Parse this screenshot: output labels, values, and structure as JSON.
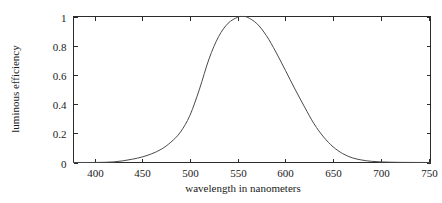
{
  "chart_data": {
    "type": "line",
    "title": "",
    "xlabel": "wavelength in nanometers",
    "ylabel": "luminous efficiency",
    "xlim": [
      378,
      752
    ],
    "ylim": [
      0,
      1
    ],
    "grid": false,
    "legend": null,
    "xticks": [
      400,
      450,
      500,
      550,
      600,
      650,
      700,
      750
    ],
    "xtick_labels": [
      "400",
      "450",
      "500",
      "550",
      "600",
      "650",
      "700",
      "750"
    ],
    "yticks": [
      0,
      0.2,
      0.4,
      0.6,
      0.8,
      1
    ],
    "ytick_labels": [
      "0",
      "0.2",
      "0.4",
      "0.6",
      "0.8",
      "1"
    ],
    "series": [
      {
        "name": "luminous efficiency",
        "color": "#4a4a4a",
        "x": [
          378,
          390,
          400,
          410,
          420,
          430,
          440,
          450,
          460,
          470,
          480,
          490,
          500,
          510,
          520,
          530,
          540,
          550,
          555,
          560,
          570,
          580,
          590,
          600,
          610,
          620,
          630,
          640,
          650,
          660,
          670,
          680,
          690,
          700,
          710,
          720,
          730,
          740,
          752
        ],
        "y": [
          0.0,
          0.0001,
          0.0004,
          0.0012,
          0.004,
          0.0116,
          0.023,
          0.038,
          0.06,
          0.091,
          0.139,
          0.208,
          0.323,
          0.503,
          0.71,
          0.862,
          0.954,
          0.995,
          1.0,
          0.995,
          0.952,
          0.87,
          0.757,
          0.631,
          0.503,
          0.381,
          0.265,
          0.175,
          0.107,
          0.061,
          0.032,
          0.017,
          0.0082,
          0.0041,
          0.0021,
          0.00105,
          0.00052,
          0.00025,
          0.0001
        ]
      }
    ]
  },
  "axes": {
    "x_axis_title": "wavelength in nanometers",
    "y_axis_title": "luminous efficiency"
  }
}
